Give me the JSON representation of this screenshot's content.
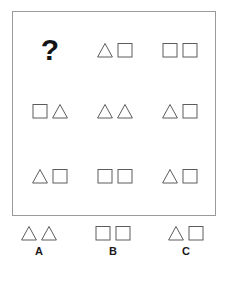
{
  "puzzle": {
    "type": "shape-sequence-matrix",
    "question_symbol": "?",
    "shape_names": {
      "triangle": "triangle-icon",
      "square": "square-icon"
    },
    "colors": {
      "panel_border": "#9a9a9a",
      "shape_stroke": "#5c5c5c",
      "text": "#1a1a1a",
      "background": "#ffffff"
    },
    "matrix": {
      "rows": [
        {
          "cells": [
            {
              "kind": "question",
              "text": "?",
              "shapes": []
            },
            {
              "kind": "shapes",
              "text": "",
              "shapes": [
                "triangle",
                "square"
              ]
            },
            {
              "kind": "shapes",
              "text": "",
              "shapes": [
                "square",
                "square"
              ]
            }
          ]
        },
        {
          "cells": [
            {
              "kind": "shapes",
              "text": "",
              "shapes": [
                "square",
                "triangle"
              ]
            },
            {
              "kind": "shapes",
              "text": "",
              "shapes": [
                "triangle",
                "triangle"
              ]
            },
            {
              "kind": "shapes",
              "text": "",
              "shapes": [
                "triangle",
                "square"
              ]
            }
          ]
        },
        {
          "cells": [
            {
              "kind": "shapes",
              "text": "",
              "shapes": [
                "triangle",
                "square"
              ]
            },
            {
              "kind": "shapes",
              "text": "",
              "shapes": [
                "square",
                "square"
              ]
            },
            {
              "kind": "shapes",
              "text": "",
              "shapes": [
                "triangle",
                "square"
              ]
            }
          ]
        }
      ]
    },
    "options": [
      {
        "label": "A",
        "shapes": [
          "triangle",
          "triangle"
        ]
      },
      {
        "label": "B",
        "shapes": [
          "square",
          "square"
        ]
      },
      {
        "label": "C",
        "shapes": [
          "triangle",
          "square"
        ]
      }
    ]
  }
}
